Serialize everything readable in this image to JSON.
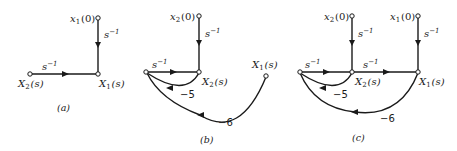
{
  "figure": {
    "panels": [
      {
        "caption": "(a)",
        "nodes": [
          {
            "id": "x1_0",
            "label_base": "x",
            "label_sub": "1",
            "label_tail": "(0)"
          },
          {
            "id": "X1_s",
            "label_base": "X",
            "label_sub": "1",
            "label_tail": "(s)"
          },
          {
            "id": "X2_s",
            "label_base": "X",
            "label_sub": "2",
            "label_tail": "(s)"
          }
        ],
        "edges": [
          {
            "from": "x1_0",
            "to": "X1_s",
            "gain": "s⁻¹"
          },
          {
            "from": "X2_s",
            "to": "X1_s",
            "gain": "s⁻¹"
          }
        ]
      },
      {
        "caption": "(b)",
        "nodes": [
          {
            "id": "x2_0",
            "label_base": "x",
            "label_sub": "2",
            "label_tail": "(0)"
          },
          {
            "id": "X2_s",
            "label_base": "X",
            "label_sub": "2",
            "label_tail": "(s)"
          },
          {
            "id": "left",
            "label_base": "",
            "label_sub": "",
            "label_tail": ""
          },
          {
            "id": "X1_s",
            "label_base": "X",
            "label_sub": "1",
            "label_tail": "(s)"
          }
        ],
        "edges": [
          {
            "from": "x2_0",
            "to": "X2_s",
            "gain": "s⁻¹"
          },
          {
            "from": "left",
            "to": "X2_s",
            "gain": "s⁻¹"
          },
          {
            "from": "X2_s",
            "to": "left",
            "gain": "−5"
          },
          {
            "from": "X1_s",
            "to": "left",
            "gain": "−6"
          }
        ]
      },
      {
        "caption": "(c)",
        "nodes": [
          {
            "id": "x2_0",
            "label_base": "x",
            "label_sub": "2",
            "label_tail": "(0)"
          },
          {
            "id": "x1_0",
            "label_base": "x",
            "label_sub": "1",
            "label_tail": "(0)"
          },
          {
            "id": "left",
            "label_base": "",
            "label_sub": "",
            "label_tail": ""
          },
          {
            "id": "X2_s",
            "label_base": "X",
            "label_sub": "2",
            "label_tail": "(s)"
          },
          {
            "id": "X1_s",
            "label_base": "X",
            "label_sub": "1",
            "label_tail": "(s)"
          }
        ],
        "edges": [
          {
            "from": "x2_0",
            "to": "X2_s",
            "gain": "s⁻¹"
          },
          {
            "from": "x1_0",
            "to": "X1_s",
            "gain": "s⁻¹"
          },
          {
            "from": "left",
            "to": "X2_s",
            "gain": "s⁻¹"
          },
          {
            "from": "X2_s",
            "to": "X1_s",
            "gain": "s⁻¹"
          },
          {
            "from": "X2_s",
            "to": "left",
            "gain": "−5"
          },
          {
            "from": "X1_s",
            "to": "left",
            "gain": "−6"
          }
        ]
      }
    ]
  },
  "labels": {
    "a": {
      "x1_0_base": "x",
      "x1_0_sub": "1",
      "x1_0_tail": "(0)",
      "X1_base": "X",
      "X1_sub": "1",
      "X1_tail": "(s)",
      "X2_base": "X",
      "X2_sub": "2",
      "X2_tail": "(s)",
      "g_vert": "s",
      "g_horiz": "s",
      "exp": "−1",
      "caption": "(a)"
    },
    "b": {
      "x2_0_base": "x",
      "x2_0_sub": "2",
      "x2_0_tail": "(0)",
      "X2_base": "X",
      "X2_sub": "2",
      "X2_tail": "(s)",
      "X1_base": "X",
      "X1_sub": "1",
      "X1_tail": "(s)",
      "g_vert": "s",
      "g_horiz": "s",
      "exp": "−1",
      "g_m5": "−5",
      "g_m6": "−6",
      "caption": "(b)"
    },
    "c": {
      "x2_0_base": "x",
      "x2_0_sub": "2",
      "x2_0_tail": "(0)",
      "x1_0_base": "x",
      "x1_0_sub": "1",
      "x1_0_tail": "(0)",
      "X2_base": "X",
      "X2_sub": "2",
      "X2_tail": "(s)",
      "X1_base": "X",
      "X1_sub": "1",
      "X1_tail": "(s)",
      "g_vert2": "s",
      "g_vert1": "s",
      "g_left": "s",
      "g_mid": "s",
      "exp": "−1",
      "g_m5": "−5",
      "g_m6": "−6",
      "caption": "(c)"
    }
  }
}
